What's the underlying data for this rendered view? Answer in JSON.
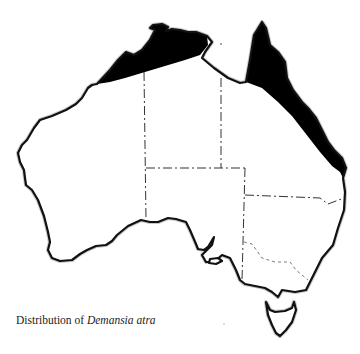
{
  "map": {
    "subject": "Australia",
    "species": "Demansia atra",
    "range_color": "#000000",
    "coast_color": "#111111",
    "regions_shaded": [
      "Northern coast: Kimberley to Arnhem Land (WA/NT)",
      "Queensland: Cape York Peninsula and east coast south to the NSW border"
    ],
    "borders": [
      "WA–NT",
      "NT–SA",
      "NT–QLD",
      "SA–QLD",
      "SA–NSW/VIC",
      "QLD–NSW",
      "NSW–VIC (Murray River)"
    ],
    "islands": [
      "Tasmania",
      "Kangaroo Island"
    ]
  },
  "caption": {
    "prefix": "Distribution of ",
    "species": "Demansia atra"
  }
}
